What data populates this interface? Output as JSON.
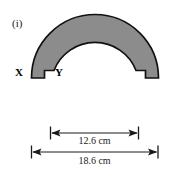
{
  "figure": {
    "label": "(i)",
    "shape_fill": "#8c8c8c",
    "shape_stroke": "#111111",
    "vertex_labels": {
      "outer": "X",
      "inner": "Y"
    }
  },
  "dimensions": [
    {
      "name": "inner-diameter",
      "label": "12.6 cm",
      "value": 12.6,
      "unit": "cm"
    },
    {
      "name": "outer-diameter",
      "label": "18.6 cm",
      "value": 18.6,
      "unit": "cm"
    }
  ]
}
